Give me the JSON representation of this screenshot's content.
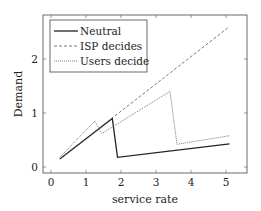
{
  "chart_data": {
    "type": "line",
    "title": "",
    "xlabel": "service rate",
    "ylabel": "Demand",
    "xlim": [
      -0.2,
      5.6
    ],
    "ylim": [
      -0.1,
      2.8
    ],
    "xticks": [
      0,
      1,
      2,
      3,
      4,
      5
    ],
    "yticks": [
      0,
      1,
      2
    ],
    "grid": false,
    "legend_position": "upper left",
    "series": [
      {
        "name": "Neutral",
        "style": "solid",
        "x": [
          0.25,
          1.75,
          1.9,
          5.1
        ],
        "y": [
          0.15,
          0.9,
          0.18,
          0.43
        ]
      },
      {
        "name": "ISP decides",
        "style": "dashed",
        "x": [
          0.25,
          5.1
        ],
        "y": [
          0.15,
          2.6
        ]
      },
      {
        "name": "Users decide",
        "style": "dotted",
        "x": [
          0.25,
          1.25,
          1.45,
          3.4,
          3.6,
          5.1
        ],
        "y": [
          0.18,
          0.85,
          0.62,
          1.4,
          0.42,
          0.58
        ]
      }
    ]
  }
}
